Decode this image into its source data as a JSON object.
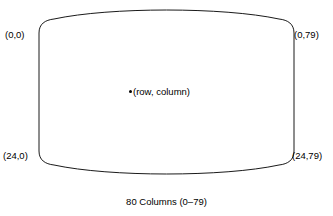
{
  "diagram": {
    "shape": {
      "name": "crt-screen-outline",
      "stroke_color": "#1a1a1a",
      "fill_color": "#ffffff",
      "stroke_width": 1
    },
    "corner_labels": {
      "top_left": "(0,0)",
      "top_right": "(0,79)",
      "bottom_left": "(24,0)",
      "bottom_right": "(24,79)"
    },
    "center_marker": {
      "dot": "bullet-point",
      "label": "(row, column)"
    },
    "caption": "80 Columns (0–79)"
  }
}
